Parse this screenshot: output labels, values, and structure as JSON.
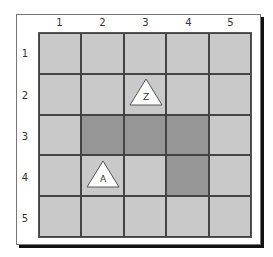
{
  "grid": {
    "columns": [
      "1",
      "2",
      "3",
      "4",
      "5"
    ],
    "rows": [
      "1",
      "2",
      "3",
      "4",
      "5"
    ],
    "cells": [
      [
        "light",
        "light",
        "light",
        "light",
        "light"
      ],
      [
        "light",
        "light",
        "light",
        "light",
        "light"
      ],
      [
        "light",
        "dark",
        "dark",
        "dark",
        "light"
      ],
      [
        "light",
        "light",
        "light",
        "dark",
        "light"
      ],
      [
        "light",
        "light",
        "light",
        "light",
        "light"
      ]
    ],
    "colors": {
      "light": "#c9c9c9",
      "dark": "#969696",
      "line": "#444444"
    }
  },
  "markers": [
    {
      "label": "Z",
      "row": 2,
      "col": 3,
      "shape": "triangle"
    },
    {
      "label": "A",
      "row": 4,
      "col": 2,
      "shape": "triangle"
    }
  ]
}
